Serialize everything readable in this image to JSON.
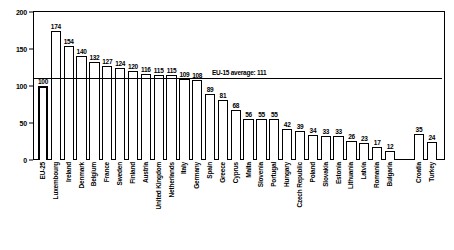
{
  "chart_data": {
    "type": "bar",
    "title": "",
    "xlabel": "",
    "ylabel": "",
    "ylim": [
      0,
      200
    ],
    "yticks": [
      0,
      50,
      100,
      150,
      200
    ],
    "grid": false,
    "legend": "none",
    "categories": [
      "EU-25",
      "Luxembourg",
      "Ireland",
      "Denmark",
      "Belgium",
      "France",
      "Sweden",
      "Finland",
      "Austria",
      "United Kingdom",
      "Netherlands",
      "Italy",
      "Germany",
      "Spain",
      "Greece",
      "Cyprus",
      "Malta",
      "Slovenia",
      "Portugal",
      "Hungary",
      "Czech Republic",
      "Poland",
      "Slovakia",
      "Estonia",
      "Lithuania",
      "Latvia",
      "Romania",
      "Bulgaria",
      "Croatia",
      "Turkey"
    ],
    "values": [
      100,
      174,
      154,
      140,
      132,
      127,
      124,
      120,
      116,
      115,
      115,
      109,
      108,
      89,
      81,
      68,
      56,
      55,
      55,
      42,
      39,
      34,
      33,
      33,
      26,
      23,
      17,
      12,
      35,
      24
    ],
    "annotations": [
      {
        "name": "eu15-average-line",
        "label": "EU-15 average: 111",
        "value": 111
      }
    ],
    "gap_after_index": 27
  },
  "axis": {
    "tick_labels": [
      "0",
      "50",
      "100",
      "150",
      "200"
    ]
  }
}
